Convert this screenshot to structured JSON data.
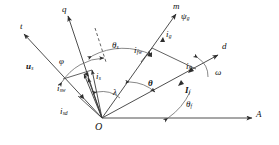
{
  "diagram": {
    "background": "#ffffff",
    "line_color": "#3a3a3a",
    "text_color": "#111111",
    "origin_label": "O",
    "axes": [
      {
        "name": "q-axis",
        "label": "q",
        "angle_deg": 112
      },
      {
        "name": "m-axis",
        "label": "m",
        "angle_deg": 62
      },
      {
        "name": "d-axis",
        "label": "d",
        "angle_deg": 30
      },
      {
        "name": "A-axis",
        "label": "A",
        "angle_deg": 0
      },
      {
        "name": "stator-voltage-axis",
        "label": "t",
        "angle_deg": 160
      }
    ],
    "vectors": [
      {
        "name": "stator-voltage",
        "label": "u",
        "sub": "s"
      },
      {
        "name": "stator-current-w-component",
        "label": "i",
        "sub": "sw"
      },
      {
        "name": "stator-current-d-component",
        "label": "i",
        "sub": "sd"
      },
      {
        "name": "stator-current",
        "label": "i",
        "sub": "s"
      },
      {
        "name": "field-current-w-component",
        "label": "i",
        "sub": "fw"
      },
      {
        "name": "air-gap-current",
        "label": "i",
        "sub": "g"
      },
      {
        "name": "air-gap-flux",
        "label": "ψ",
        "sub": "g"
      },
      {
        "name": "field-current-d-component",
        "label": "i",
        "sub": "fl"
      },
      {
        "name": "field-current-total",
        "label": "I",
        "sub": "f"
      }
    ],
    "angles": [
      {
        "name": "angle-phi",
        "label": "φ"
      },
      {
        "name": "angle-theta-s",
        "label": "θ",
        "sub": "s"
      },
      {
        "name": "angle-lambda",
        "label": "λ"
      },
      {
        "name": "angle-theta",
        "label": "θ"
      },
      {
        "name": "angle-theta-f",
        "label": "θ",
        "sub": "f"
      },
      {
        "name": "angle-omega",
        "label": "ω"
      }
    ]
  }
}
